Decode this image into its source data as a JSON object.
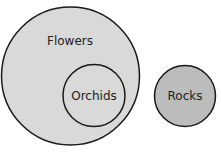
{
  "diagram": {
    "type": "euler",
    "sets": [
      {
        "label": "Flowers",
        "fill": "#d9d9d9"
      },
      {
        "label": "Orchids",
        "fill": "#d9d9d9"
      },
      {
        "label": "Rocks",
        "fill": "#bcbcbc"
      }
    ],
    "stroke": "#1a1a1a"
  }
}
